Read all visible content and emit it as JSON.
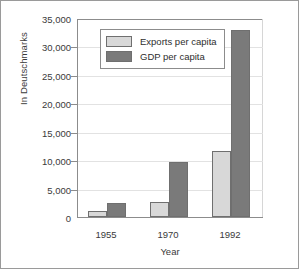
{
  "chart_data": {
    "type": "bar",
    "title": "",
    "subtitle": "",
    "xlabel": "Year",
    "ylabel": "In Deutschmarks",
    "categories": [
      "1955",
      "1970",
      "1992"
    ],
    "series": [
      {
        "name": "Exports per capita",
        "color": "#d8d8d8",
        "values": [
          1000,
          2600,
          11600
        ]
      },
      {
        "name": "GDP per capita",
        "color": "#7a7a7a",
        "values": [
          2500,
          9600,
          32900
        ]
      }
    ],
    "ylim": [
      0,
      35000
    ],
    "yticks": [
      0,
      5000,
      10000,
      15000,
      20000,
      25000,
      30000,
      35000
    ],
    "ytick_labels": [
      "0",
      "5,000",
      "10,000",
      "15,000",
      "20,000",
      "25,000",
      "30,000",
      "35,000"
    ],
    "grid": true,
    "legend_position": "upper-left-inside"
  },
  "legend": {
    "entries": [
      {
        "label": "Exports per capita",
        "swatch": "#d8d8d8"
      },
      {
        "label": "GDP per capita",
        "swatch": "#7a7a7a"
      }
    ]
  },
  "colors": {
    "exports": "#d8d8d8",
    "gdp": "#7a7a7a",
    "axis": "#8c8c8c",
    "grid": "#e2e2e2",
    "text": "#3a3a3a",
    "frame": "#9a9a9a"
  }
}
